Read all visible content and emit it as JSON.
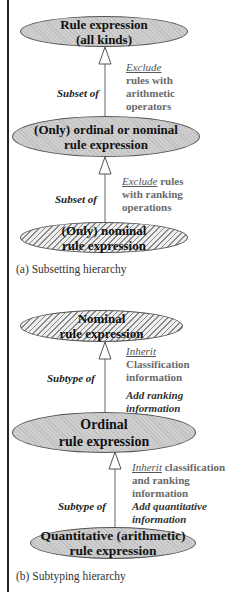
{
  "diagram": {
    "part_a": {
      "caption": "(a) Subsetting hierarchy",
      "nodes": [
        {
          "line1": "Rule expression",
          "line2": "(all kinds)",
          "fill": "solid"
        },
        {
          "line1": "(Only) ordinal or nominal",
          "line2": "rule expression",
          "fill": "solid"
        },
        {
          "line1": "(Only) nominal",
          "line2": "rule expression",
          "fill": "hatched"
        }
      ],
      "edges": [
        {
          "label": "Subset of",
          "note_keyword": "Exclude",
          "note_lines": [
            "rules with",
            "arithmetic",
            "operators"
          ]
        },
        {
          "label": "Subset of",
          "note_keyword": "Exclude",
          "note_after_keyword": " rules",
          "note_lines": [
            "with ranking",
            "operations"
          ]
        }
      ]
    },
    "part_b": {
      "caption": "(b) Subtyping hierarchy",
      "nodes": [
        {
          "line1": "Nominal",
          "line2": "rule expression",
          "fill": "hatched"
        },
        {
          "line1": "Ordinal",
          "line2": "rule expression",
          "fill": "solid"
        },
        {
          "line1": "Quantitative (arithmetic)",
          "line2": "rule expression",
          "fill": "solid"
        }
      ],
      "edges": [
        {
          "label": "Subtype of",
          "note_keyword": "Inherit",
          "note_lines": [
            "Classification",
            "information"
          ],
          "add_lines": [
            "Add ranking",
            "information"
          ]
        },
        {
          "label": "Subtype of",
          "note_keyword": "Inherit",
          "note_after_keyword": " classification",
          "note_lines": [
            "and ranking",
            "information"
          ],
          "add_lines": [
            "Add quantitative",
            "information"
          ]
        }
      ]
    }
  }
}
